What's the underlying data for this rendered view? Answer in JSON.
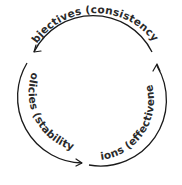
{
  "diagram": {
    "type": "cycle",
    "nodes": [
      {
        "id": "objectives",
        "label": "Objectives (consistency)",
        "position": "top"
      },
      {
        "id": "policies",
        "label": "Policies (stability)",
        "position": "left"
      },
      {
        "id": "actions",
        "label": "Actions (effectiveness)",
        "position": "right"
      }
    ],
    "edges": [
      {
        "from": "actions",
        "to": "objectives",
        "direction": "counterclockwise"
      },
      {
        "from": "objectives",
        "to": "policies",
        "direction": "counterclockwise"
      },
      {
        "from": "policies",
        "to": "actions",
        "direction": "counterclockwise"
      }
    ],
    "labels": {
      "objectives": "Objectives (consistency)",
      "policies": "Policies (stability)",
      "actions": "Actions (effectiveness)"
    },
    "colors": {
      "stroke": "#1a1a1a",
      "text": "#2a2a2a",
      "background": "#ffffff"
    }
  }
}
